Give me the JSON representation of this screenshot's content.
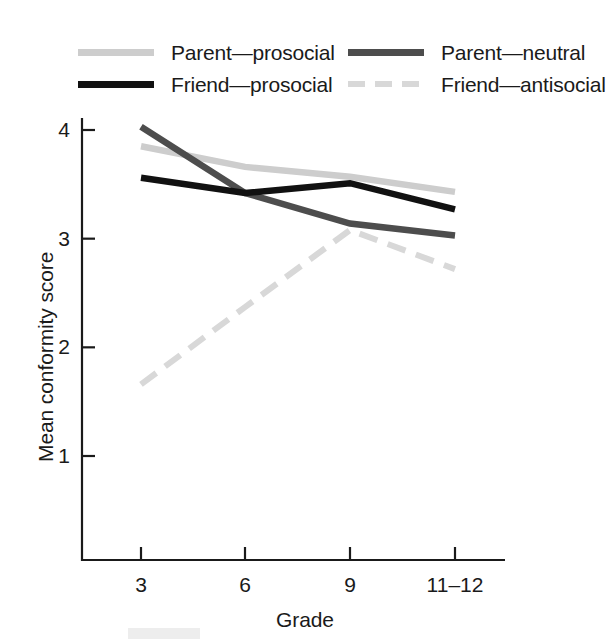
{
  "chart_data": {
    "type": "line",
    "title": "",
    "xlabel": "Grade",
    "ylabel": "Mean conformity score",
    "categories": [
      "3",
      "6",
      "9",
      "11–12"
    ],
    "ylim": [
      0,
      4.35
    ],
    "yticks": [
      1,
      2,
      3,
      4
    ],
    "ytick_labels": [
      "1",
      "2",
      "3",
      "4"
    ],
    "grid": false,
    "legend_position": "top",
    "series": [
      {
        "name": "Parent—prosocial",
        "values": [
          3.85,
          3.66,
          3.57,
          3.43
        ],
        "color": "#cdcdcd",
        "style": "solid"
      },
      {
        "name": "Parent—neutral",
        "values": [
          4.03,
          3.42,
          3.14,
          3.03
        ],
        "color": "#4d4d4d",
        "style": "solid"
      },
      {
        "name": "Friend—prosocial",
        "values": [
          3.56,
          3.42,
          3.51,
          3.27
        ],
        "color": "#111111",
        "style": "solid"
      },
      {
        "name": "Friend—antisocial",
        "values": [
          1.66,
          2.37,
          3.08,
          2.72
        ],
        "color": "#d8d8d8",
        "style": "dashed"
      }
    ]
  },
  "legend": {
    "entries": [
      {
        "label": "Parent—prosocial"
      },
      {
        "label": "Parent—neutral"
      },
      {
        "label": "Friend—prosocial"
      },
      {
        "label": "Friend—antisocial"
      }
    ]
  },
  "axes": {
    "x_label": "Grade",
    "y_label": "Mean conformity score",
    "x_tick_labels": [
      "3",
      "6",
      "9",
      "11–12"
    ],
    "y_tick_labels": [
      "1",
      "2",
      "3",
      "4"
    ]
  }
}
